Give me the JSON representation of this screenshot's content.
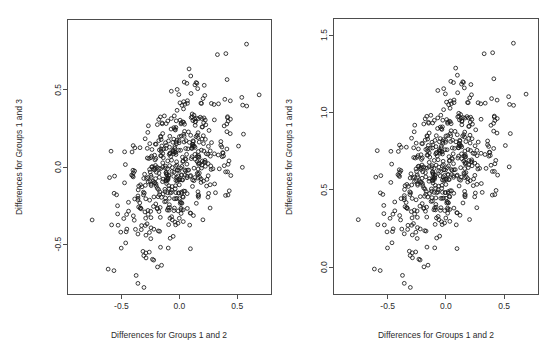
{
  "figure": {
    "title": "",
    "background_color": "#ffffff",
    "width": 560,
    "height": 355,
    "panel_count": 2
  },
  "style": {
    "point_color": "#1a1a1a",
    "axis_color": "#4d4d4d",
    "text_color": "#2b2b2b",
    "point_symbol": "open-circle",
    "point_radius_px": 1.9
  },
  "chart_data": [
    {
      "panel": "left",
      "type": "scatter",
      "title": "",
      "xlabel": "Differences for Groups 1 and 2",
      "ylabel": "Differences for Groups 1 and 3",
      "xticks": [
        -0.5,
        0.0,
        0.5
      ],
      "xticklabels": [
        "-0.5",
        "0.0",
        "0.5"
      ],
      "yticks": [
        -0.5,
        0.0,
        0.5
      ],
      "yticklabels": [
        "-0.5",
        "0.0",
        "0.5"
      ],
      "xlim": [
        -0.97,
        0.8
      ],
      "ylim": [
        -0.83,
        0.96
      ],
      "grid": false,
      "legend": false,
      "n_points": 520,
      "correlation": 0.45,
      "x_mean": -0.02,
      "x_sd": 0.235,
      "y_mean": 0.0,
      "y_sd": 0.255,
      "y_offset": 0.0,
      "seed": 20240517,
      "marker": "o"
    },
    {
      "panel": "right",
      "type": "scatter",
      "title": "",
      "xlabel": "Differences for Groups 1 and 2",
      "ylabel": "Differences for Groups 1 and 3",
      "xticks": [
        -0.5,
        0.0,
        0.5
      ],
      "xticklabels": [
        "-0.5",
        "0.0",
        "0.5"
      ],
      "yticks": [
        0.0,
        0.5,
        1.0,
        1.5
      ],
      "yticklabels": [
        "0.0",
        "0.5",
        "1.0",
        "1.5"
      ],
      "xlim": [
        -0.97,
        0.8
      ],
      "ylim": [
        -0.18,
        1.61
      ],
      "grid": false,
      "legend": false,
      "n_points": 520,
      "correlation": 0.45,
      "x_mean": -0.02,
      "x_sd": 0.235,
      "y_mean": 0.65,
      "y_sd": 0.255,
      "y_offset": 0.65,
      "seed": 20240517,
      "marker": "o"
    }
  ],
  "panels": {
    "left": {
      "name": "left-scatter-panel",
      "plot_box_px": {
        "x": 67,
        "y": 19,
        "width": 205,
        "height": 276
      },
      "xlabel": "Differences for Groups 1 and 2",
      "ylabel": "Differences for Groups 1 and 3"
    },
    "right": {
      "name": "right-scatter-panel",
      "plot_box_px": {
        "x": 53,
        "y": 18,
        "width": 206,
        "height": 277
      },
      "xlabel": "Differences for Groups 1 and 2",
      "ylabel": "Differences for Groups 1 and 3"
    }
  }
}
